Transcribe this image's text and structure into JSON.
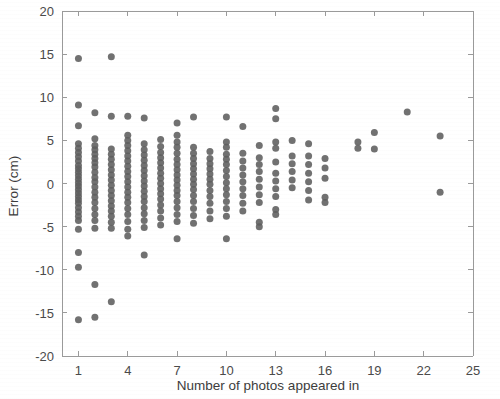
{
  "chart_data": {
    "type": "scatter",
    "title": "",
    "xlabel": "Number of photos appeared in",
    "ylabel": "Error (cm)",
    "xlim": [
      0,
      25
    ],
    "ylim": [
      -20,
      20
    ],
    "xticks": [
      1,
      4,
      7,
      10,
      13,
      16,
      19,
      22,
      25
    ],
    "xtick_labels": [
      "1",
      "4",
      "7",
      "10",
      "13",
      "16",
      "19",
      "22",
      "25"
    ],
    "yticks": [
      -20,
      -15,
      -10,
      -5,
      0,
      5,
      10,
      15,
      20
    ],
    "ytick_labels": [
      "-20",
      "-15",
      "-10",
      "-5",
      "0",
      "5",
      "10",
      "15",
      "20"
    ],
    "grid": false,
    "legend": null,
    "marker_color": "#5d5d5d",
    "marker_size": 7,
    "series": [
      {
        "name": "Error per photo count",
        "points": [
          [
            1,
            14.5
          ],
          [
            1,
            9.1
          ],
          [
            1,
            6.7
          ],
          [
            1,
            4.6
          ],
          [
            1,
            4.1
          ],
          [
            1,
            3.6
          ],
          [
            1,
            3.1
          ],
          [
            1,
            2.6
          ],
          [
            1,
            2.1
          ],
          [
            1,
            1.7
          ],
          [
            1,
            1.3
          ],
          [
            1,
            0.9
          ],
          [
            1,
            0.5
          ],
          [
            1,
            0.1
          ],
          [
            1,
            -0.3
          ],
          [
            1,
            -0.7
          ],
          [
            1,
            -1.1
          ],
          [
            1,
            -1.5
          ],
          [
            1,
            -1.9
          ],
          [
            1,
            -2.3
          ],
          [
            1,
            -2.8
          ],
          [
            1,
            -3.3
          ],
          [
            1,
            -3.8
          ],
          [
            1,
            -4.3
          ],
          [
            1,
            -5.3
          ],
          [
            1,
            -8.0
          ],
          [
            1,
            -9.7
          ],
          [
            1,
            -15.8
          ],
          [
            2,
            8.2
          ],
          [
            2,
            5.2
          ],
          [
            2,
            4.4
          ],
          [
            2,
            3.9
          ],
          [
            2,
            3.4
          ],
          [
            2,
            2.9
          ],
          [
            2,
            2.4
          ],
          [
            2,
            1.9
          ],
          [
            2,
            1.3
          ],
          [
            2,
            0.7
          ],
          [
            2,
            0.2
          ],
          [
            2,
            -0.4
          ],
          [
            2,
            -1.0
          ],
          [
            2,
            -1.6
          ],
          [
            2,
            -2.2
          ],
          [
            2,
            -2.9
          ],
          [
            2,
            -3.6
          ],
          [
            2,
            -4.3
          ],
          [
            2,
            -5.2
          ],
          [
            2,
            -11.7
          ],
          [
            2,
            -15.5
          ],
          [
            3,
            14.7
          ],
          [
            3,
            7.8
          ],
          [
            3,
            4.0
          ],
          [
            3,
            3.4
          ],
          [
            3,
            2.8
          ],
          [
            3,
            2.2
          ],
          [
            3,
            1.6
          ],
          [
            3,
            1.0
          ],
          [
            3,
            0.4
          ],
          [
            3,
            -0.2
          ],
          [
            3,
            -0.8
          ],
          [
            3,
            -1.4
          ],
          [
            3,
            -2.0
          ],
          [
            3,
            -2.6
          ],
          [
            3,
            -3.2
          ],
          [
            3,
            -3.8
          ],
          [
            3,
            -4.5
          ],
          [
            3,
            -5.2
          ],
          [
            3,
            -13.7
          ],
          [
            4,
            7.8
          ],
          [
            4,
            5.6
          ],
          [
            4,
            5.0
          ],
          [
            4,
            4.4
          ],
          [
            4,
            3.8
          ],
          [
            4,
            3.2
          ],
          [
            4,
            2.6
          ],
          [
            4,
            2.0
          ],
          [
            4,
            1.4
          ],
          [
            4,
            0.8
          ],
          [
            4,
            0.2
          ],
          [
            4,
            -0.4
          ],
          [
            4,
            -1.0
          ],
          [
            4,
            -1.6
          ],
          [
            4,
            -2.2
          ],
          [
            4,
            -2.9
          ],
          [
            4,
            -3.6
          ],
          [
            4,
            -4.4
          ],
          [
            4,
            -5.3
          ],
          [
            4,
            -6.1
          ],
          [
            5,
            7.6
          ],
          [
            5,
            4.6
          ],
          [
            5,
            3.9
          ],
          [
            5,
            3.3
          ],
          [
            5,
            2.7
          ],
          [
            5,
            2.1
          ],
          [
            5,
            1.5
          ],
          [
            5,
            0.9
          ],
          [
            5,
            0.3
          ],
          [
            5,
            -0.3
          ],
          [
            5,
            -0.9
          ],
          [
            5,
            -1.5
          ],
          [
            5,
            -2.1
          ],
          [
            5,
            -2.8
          ],
          [
            5,
            -3.5
          ],
          [
            5,
            -4.3
          ],
          [
            5,
            -5.1
          ],
          [
            5,
            -8.3
          ],
          [
            6,
            5.1
          ],
          [
            6,
            4.3
          ],
          [
            6,
            3.6
          ],
          [
            6,
            3.0
          ],
          [
            6,
            2.4
          ],
          [
            6,
            1.8
          ],
          [
            6,
            1.2
          ],
          [
            6,
            0.6
          ],
          [
            6,
            0.0
          ],
          [
            6,
            -0.6
          ],
          [
            6,
            -1.2
          ],
          [
            6,
            -1.8
          ],
          [
            6,
            -2.5
          ],
          [
            6,
            -3.2
          ],
          [
            6,
            -4.0
          ],
          [
            6,
            -4.8
          ],
          [
            7,
            7.0
          ],
          [
            7,
            5.6
          ],
          [
            7,
            4.8
          ],
          [
            7,
            4.2
          ],
          [
            7,
            3.5
          ],
          [
            7,
            2.8
          ],
          [
            7,
            2.2
          ],
          [
            7,
            1.6
          ],
          [
            7,
            1.0
          ],
          [
            7,
            0.4
          ],
          [
            7,
            -0.2
          ],
          [
            7,
            -0.8
          ],
          [
            7,
            -1.4
          ],
          [
            7,
            -2.1
          ],
          [
            7,
            -2.8
          ],
          [
            7,
            -3.6
          ],
          [
            7,
            -4.4
          ],
          [
            7,
            -6.4
          ],
          [
            8,
            7.7
          ],
          [
            8,
            4.2
          ],
          [
            8,
            3.5
          ],
          [
            8,
            2.9
          ],
          [
            8,
            2.3
          ],
          [
            8,
            1.7
          ],
          [
            8,
            1.1
          ],
          [
            8,
            0.5
          ],
          [
            8,
            -0.1
          ],
          [
            8,
            -0.7
          ],
          [
            8,
            -1.4
          ],
          [
            8,
            -2.1
          ],
          [
            8,
            -2.9
          ],
          [
            8,
            -3.7
          ],
          [
            8,
            -4.6
          ],
          [
            9,
            3.7
          ],
          [
            9,
            2.9
          ],
          [
            9,
            2.3
          ],
          [
            9,
            1.7
          ],
          [
            9,
            1.1
          ],
          [
            9,
            0.5
          ],
          [
            9,
            -0.1
          ],
          [
            9,
            -0.8
          ],
          [
            9,
            -1.5
          ],
          [
            9,
            -2.3
          ],
          [
            9,
            -3.2
          ],
          [
            9,
            -4.1
          ],
          [
            10,
            7.7
          ],
          [
            10,
            4.8
          ],
          [
            10,
            4.2
          ],
          [
            10,
            3.4
          ],
          [
            10,
            2.8
          ],
          [
            10,
            2.2
          ],
          [
            10,
            1.5
          ],
          [
            10,
            0.8
          ],
          [
            10,
            0.1
          ],
          [
            10,
            -0.6
          ],
          [
            10,
            -1.3
          ],
          [
            10,
            -2.1
          ],
          [
            10,
            -2.9
          ],
          [
            10,
            -3.8
          ],
          [
            10,
            -6.4
          ],
          [
            11,
            6.6
          ],
          [
            11,
            3.5
          ],
          [
            11,
            2.6
          ],
          [
            11,
            1.8
          ],
          [
            11,
            1.0
          ],
          [
            11,
            0.2
          ],
          [
            11,
            -0.6
          ],
          [
            11,
            -1.4
          ],
          [
            11,
            -2.3
          ],
          [
            11,
            -3.2
          ],
          [
            12,
            4.4
          ],
          [
            12,
            3.0
          ],
          [
            12,
            2.2
          ],
          [
            12,
            1.4
          ],
          [
            12,
            0.5
          ],
          [
            12,
            -0.4
          ],
          [
            12,
            -1.3
          ],
          [
            12,
            -2.2
          ],
          [
            12,
            -4.5
          ],
          [
            12,
            -5.0
          ],
          [
            13,
            8.7
          ],
          [
            13,
            7.5
          ],
          [
            13,
            4.8
          ],
          [
            13,
            4.1
          ],
          [
            13,
            2.5
          ],
          [
            13,
            1.2
          ],
          [
            13,
            0.3
          ],
          [
            13,
            -0.6
          ],
          [
            13,
            -1.5
          ],
          [
            13,
            -3.0
          ],
          [
            13,
            -3.6
          ],
          [
            14,
            5.0
          ],
          [
            14,
            3.2
          ],
          [
            14,
            2.3
          ],
          [
            14,
            1.4
          ],
          [
            14,
            0.4
          ],
          [
            14,
            -0.5
          ],
          [
            15,
            4.6
          ],
          [
            15,
            3.2
          ],
          [
            15,
            2.2
          ],
          [
            15,
            1.2
          ],
          [
            15,
            0.2
          ],
          [
            15,
            -0.8
          ],
          [
            15,
            -1.9
          ],
          [
            16,
            2.9
          ],
          [
            16,
            1.8
          ],
          [
            16,
            0.6
          ],
          [
            16,
            -1.6
          ],
          [
            16,
            -2.2
          ],
          [
            18,
            4.8
          ],
          [
            18,
            4.1
          ],
          [
            19,
            5.9
          ],
          [
            19,
            4.0
          ],
          [
            21,
            8.3
          ],
          [
            23,
            5.5
          ],
          [
            23,
            -1.0
          ]
        ]
      }
    ]
  },
  "axes": {
    "x_axis_name": "x-axis",
    "y_axis_name": "y-axis"
  }
}
